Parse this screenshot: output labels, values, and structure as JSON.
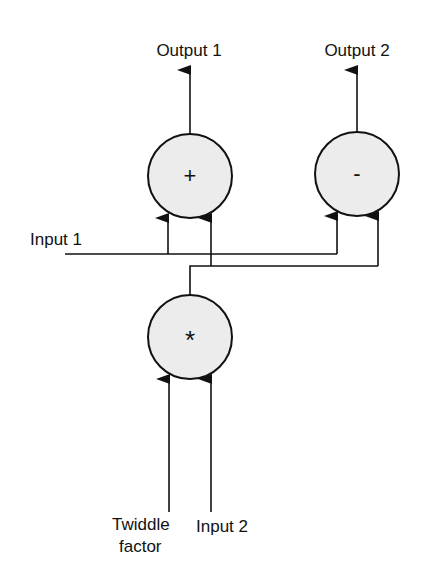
{
  "diagram": {
    "type": "FFT butterfly",
    "colors": {
      "stroke": "#111111",
      "node_fill": "#ececec",
      "background": "#ffffff"
    },
    "nodes": [
      {
        "id": "adder",
        "symbol": "+"
      },
      {
        "id": "subtractor",
        "symbol": "-"
      },
      {
        "id": "multiplier",
        "symbol": "*"
      }
    ],
    "labels": {
      "output1": "Output 1",
      "output2": "Output 2",
      "input1": "Input 1",
      "twiddle_line1": "Twiddle",
      "twiddle_line2": "factor",
      "input2": "Input 2"
    },
    "edges": [
      {
        "from": "Input 1",
        "to": "adder"
      },
      {
        "from": "Input 1",
        "to": "subtractor"
      },
      {
        "from": "multiplier",
        "to": "adder"
      },
      {
        "from": "multiplier",
        "to": "subtractor"
      },
      {
        "from": "Twiddle factor",
        "to": "multiplier"
      },
      {
        "from": "Input 2",
        "to": "multiplier"
      },
      {
        "from": "adder",
        "to": "Output 1"
      },
      {
        "from": "subtractor",
        "to": "Output 2"
      }
    ]
  }
}
